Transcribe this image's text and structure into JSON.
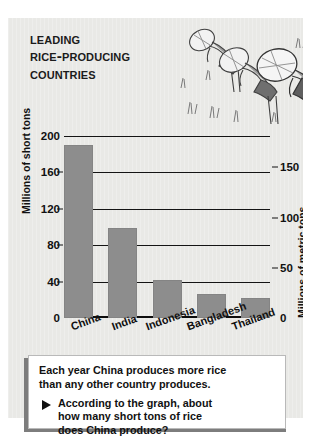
{
  "title": {
    "line1": "Leading",
    "line2": "Rice-Producing",
    "line3": "Countries"
  },
  "illustration": {
    "name": "rice-farmers-illustration",
    "description": "Three stooping farmers in conical hats planting rice in a paddy field with grass tufts"
  },
  "chart_data": {
    "type": "bar",
    "title": "Leading Rice-Producing Countries",
    "categories": [
      "China",
      "India",
      "Indonesia",
      "Bangladesh",
      "Thailand"
    ],
    "values": [
      190,
      99,
      42,
      26,
      22
    ],
    "series": [
      {
        "name": "Rice production",
        "values": [
          190,
          99,
          42,
          26,
          22
        ]
      }
    ],
    "xlabel": "",
    "ylabel": "Millions of short tons",
    "ylabel_right": "Millions of metric tons",
    "ylim": [
      0,
      200
    ],
    "yticks": [
      0,
      40,
      80,
      120,
      160,
      200
    ],
    "ylim_right": [
      0,
      181
    ],
    "yticks_right": [
      0,
      50,
      100,
      150
    ],
    "grid": true,
    "legend": "none",
    "bar_color": "#8d8d8d"
  },
  "axis_left": {
    "title": "Millions of short tons",
    "ticks": [
      "200",
      "160",
      "120",
      "80",
      "40",
      "0"
    ]
  },
  "axis_right": {
    "title": "Millions of metric tons",
    "ticks": [
      "150",
      "100",
      "50",
      "0"
    ]
  },
  "caption": {
    "statement_line1": "Each year China produces more rice",
    "statement_line2": "than any other country produces.",
    "bullet_icon": "triangle-bullet-icon",
    "question_line1": "According to the graph, about",
    "question_line2": "how many short tons of rice",
    "question_line3": "does China produce?"
  }
}
